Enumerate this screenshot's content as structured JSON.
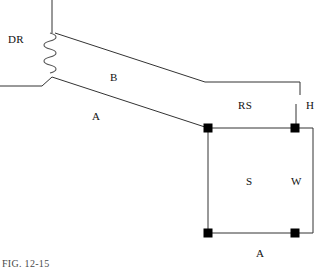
{
  "figure": {
    "caption": "FIG. 12-15",
    "background_color": "#ffffff",
    "line_color": "#333333",
    "marker_color": "#000000"
  },
  "labels": {
    "dr": "DR",
    "b": "B",
    "a_upper": "A",
    "rs": "RS",
    "h": "H",
    "s": "S",
    "w": "W",
    "a_lower": "A"
  },
  "geometry": {
    "riser_line": {
      "x": 52,
      "y_top": 0,
      "y_bottom": 33
    },
    "coil": {
      "x": 50,
      "y_top": 33,
      "y_bottom": 72,
      "turns": 5,
      "amplitude": 6
    },
    "ground_line": {
      "x1": 0,
      "y1": 86,
      "x2": 50,
      "y2": 78
    },
    "line_b": {
      "x1": 56,
      "y1": 33,
      "x2": 205,
      "y2": 82
    },
    "line_rs": {
      "x1": 205,
      "y1": 82,
      "x2": 300,
      "y2": 82
    },
    "rs_drop": {
      "x": 300,
      "y1": 82,
      "y2": 100
    },
    "line_a": {
      "x1": 52,
      "y1": 76,
      "x2": 208,
      "y2": 128
    },
    "h_stub": {
      "x": 296,
      "y1": 100,
      "y2": 128
    },
    "rectangle": {
      "left": 208,
      "top": 128,
      "right": 295,
      "bottom": 233
    },
    "right_extension": {
      "x1": 295,
      "y1": 128,
      "x2": 313,
      "y2": 128
    },
    "right_edge": {
      "x": 313,
      "y1": 128,
      "y2": 233
    },
    "bottom_extension": {
      "x1": 295,
      "y1": 233,
      "x2": 313,
      "y2": 233
    },
    "corner_markers": [
      {
        "cx": 208,
        "cy": 128,
        "name": "top-left"
      },
      {
        "cx": 295,
        "cy": 128,
        "name": "top-right"
      },
      {
        "cx": 295,
        "cy": 233,
        "name": "bottom-right"
      },
      {
        "cx": 208,
        "cy": 233,
        "name": "bottom-left"
      }
    ],
    "marker_size": 9
  }
}
